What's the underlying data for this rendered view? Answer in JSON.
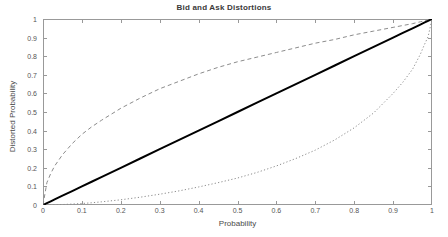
{
  "chart_data": {
    "type": "line",
    "title": "Bid and Ask Distortions",
    "xlabel": "Probability",
    "ylabel": "Distorted Probability",
    "xlim": [
      0,
      1
    ],
    "ylim": [
      0,
      1
    ],
    "grid": false,
    "legend_position": "none",
    "xticks": [
      "0",
      "0.1",
      "0.2",
      "0.3",
      "0.4",
      "0.5",
      "0.6",
      "0.7",
      "0.8",
      "0.9",
      "1"
    ],
    "xtick_values": [
      0,
      0.1,
      0.2,
      0.3,
      0.4,
      0.5,
      0.6,
      0.7,
      0.8,
      0.9,
      1
    ],
    "yticks": [
      "0",
      "0.1",
      "0.2",
      "0.3",
      "0.4",
      "0.5",
      "0.6",
      "0.7",
      "0.8",
      "0.9",
      "1"
    ],
    "ytick_values": [
      0,
      0.1,
      0.2,
      0.3,
      0.4,
      0.5,
      0.6,
      0.7,
      0.8,
      0.9,
      1
    ],
    "x": [
      0,
      0.01,
      0.02,
      0.03,
      0.05,
      0.075,
      0.1,
      0.125,
      0.15,
      0.2,
      0.25,
      0.3,
      0.35,
      0.4,
      0.45,
      0.5,
      0.55,
      0.6,
      0.65,
      0.7,
      0.75,
      0.8,
      0.85,
      0.9,
      0.925,
      0.95,
      0.97,
      0.98,
      0.99,
      1
    ],
    "series": [
      {
        "name": "Ask Distortion",
        "style": "dashed",
        "color": "#8c8c8c",
        "width": 1,
        "values": [
          0,
          0.12,
          0.17,
          0.21,
          0.27,
          0.33,
          0.38,
          0.42,
          0.455,
          0.52,
          0.575,
          0.625,
          0.665,
          0.705,
          0.74,
          0.77,
          0.795,
          0.82,
          0.845,
          0.87,
          0.89,
          0.915,
          0.935,
          0.955,
          0.965,
          0.975,
          0.985,
          0.99,
          0.995,
          1
        ]
      },
      {
        "name": "Identity",
        "style": "solid",
        "color": "#000000",
        "width": 2,
        "values": [
          0,
          0.01,
          0.02,
          0.03,
          0.05,
          0.075,
          0.1,
          0.125,
          0.15,
          0.2,
          0.25,
          0.3,
          0.35,
          0.4,
          0.45,
          0.5,
          0.55,
          0.6,
          0.65,
          0.7,
          0.75,
          0.8,
          0.85,
          0.9,
          0.925,
          0.95,
          0.97,
          0.98,
          0.99,
          1
        ]
      },
      {
        "name": "Bid Distortion",
        "style": "dotted",
        "color": "#8c8c8c",
        "width": 1,
        "values": [
          0,
          0.0002,
          0.0006,
          0.0012,
          0.0025,
          0.005,
          0.008,
          0.012,
          0.017,
          0.028,
          0.042,
          0.058,
          0.076,
          0.097,
          0.12,
          0.145,
          0.175,
          0.21,
          0.25,
          0.295,
          0.35,
          0.415,
          0.495,
          0.6,
          0.66,
          0.73,
          0.81,
          0.86,
          0.905,
          1
        ]
      }
    ]
  },
  "axes": {
    "box": true,
    "tick_direction": "in",
    "axis_color": "#999999"
  }
}
